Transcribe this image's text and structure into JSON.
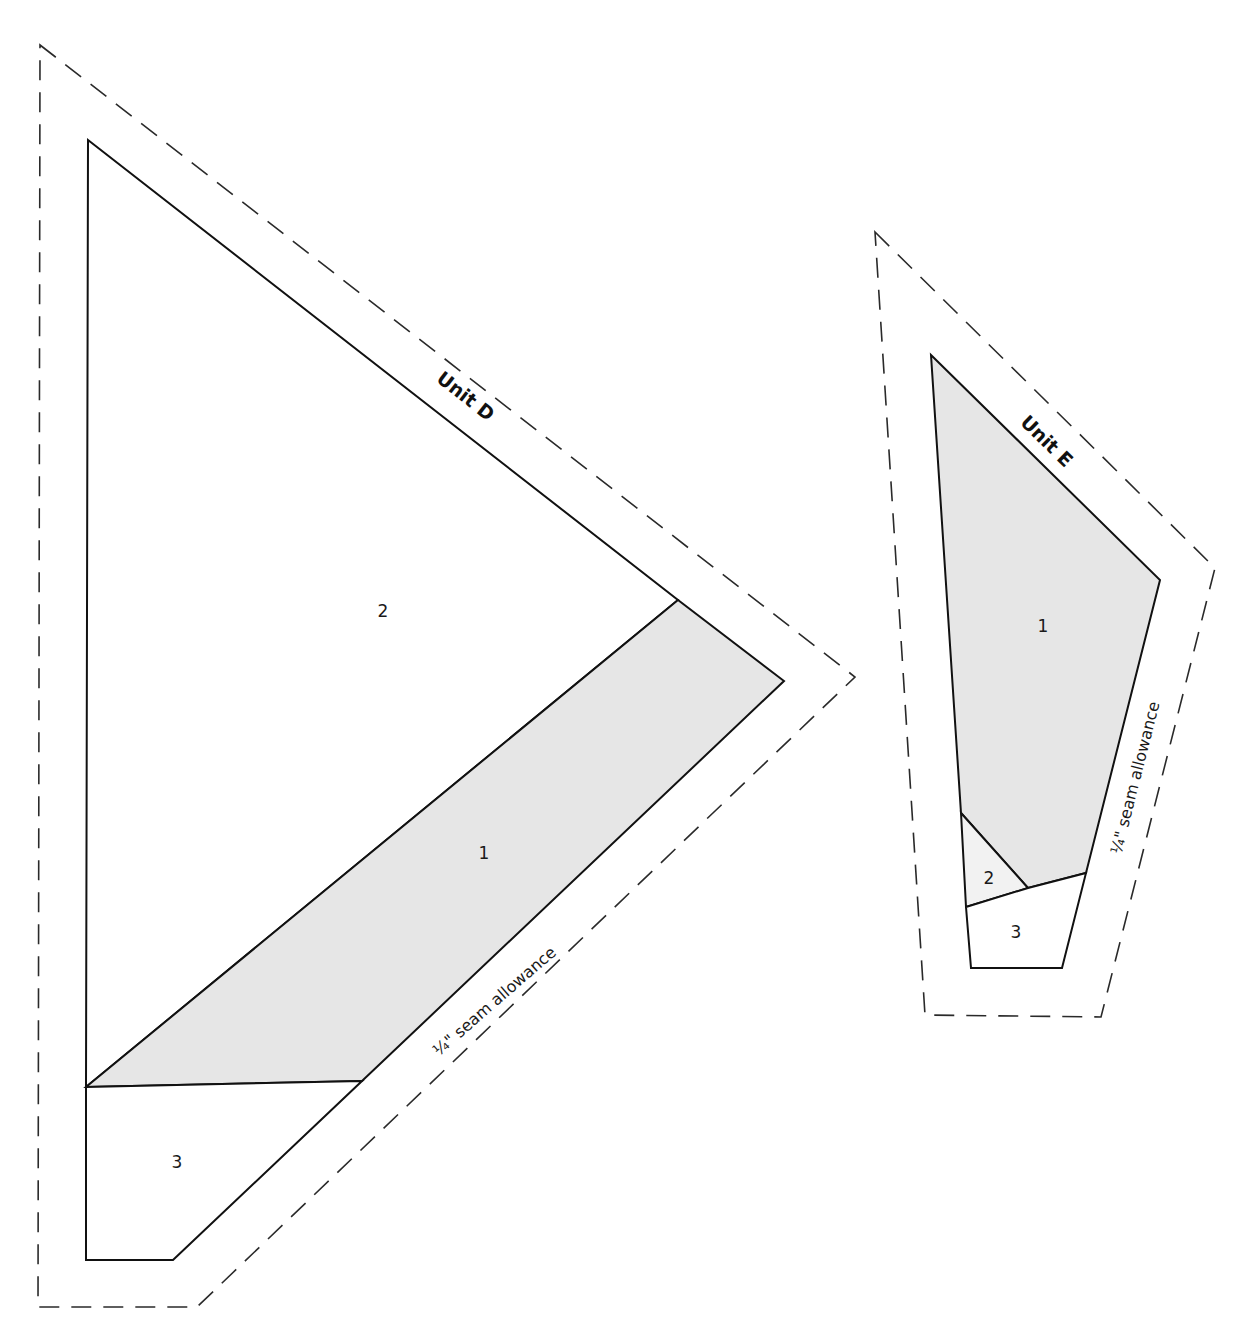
{
  "colors": {
    "background": "#ffffff",
    "shaded_piece": "#e6e6e6",
    "light_shaded_piece": "#f2f2f2",
    "unshaded_piece": "#ffffff",
    "line": "#111111"
  },
  "unit_d": {
    "label": "Unit D",
    "seam_allowance_label": "¼\" seam allowance",
    "pieces": [
      {
        "number": "1",
        "shade": "shaded"
      },
      {
        "number": "2",
        "shade": "unshaded"
      },
      {
        "number": "3",
        "shade": "unshaded"
      }
    ]
  },
  "unit_e": {
    "label": "Unit E",
    "seam_allowance_label": "¼\" seam allowance",
    "pieces": [
      {
        "number": "1",
        "shade": "shaded"
      },
      {
        "number": "2",
        "shade": "light-shaded"
      },
      {
        "number": "3",
        "shade": "unshaded"
      }
    ]
  }
}
